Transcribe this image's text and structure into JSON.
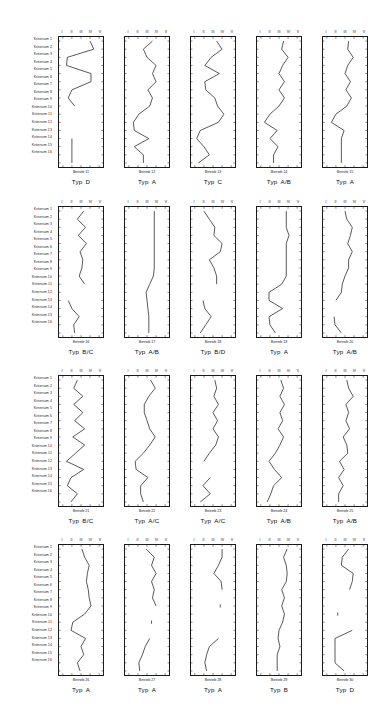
{
  "figure": {
    "criteria_label_prefix": "Kriterium",
    "criteria": [
      "Kriterium  1",
      "Kriterium  2",
      "Kriterium  3",
      "Kriterium  4",
      "Kriterium  5",
      "Kriterium  6",
      "Kriterium  7",
      "Kriterium  8",
      "Kriterium  9",
      "Kriterium 10",
      "Kriterium 11",
      "Kriterium 12",
      "Kriterium 13",
      "Kriterium 14",
      "Kriterium 15",
      "Kriterium 16"
    ],
    "scale_labels": [
      "I",
      "II",
      "III",
      "IV",
      "V"
    ],
    "type_word": "Typ",
    "rows": 4,
    "cols": 5,
    "line_color": "#1a1a1a",
    "frame_color": "#1a1a1a",
    "background": "#ffffff"
  },
  "chart_data": [
    {
      "type": "line",
      "title": "Betrieb 11",
      "subtitle": "Typ  D",
      "betrieb": "Betrieb 11",
      "typ": "D",
      "xlabel": "",
      "ylabel": "Kriterium",
      "xlim": [
        1,
        5
      ],
      "x_ticks": [
        "I",
        "II",
        "III",
        "IV",
        "V"
      ],
      "categories": [
        "Kriterium  1",
        "Kriterium  2",
        "Kriterium  3",
        "Kriterium  4",
        "Kriterium  5",
        "Kriterium  6",
        "Kriterium  7",
        "Kriterium  8",
        "Kriterium  9",
        "Kriterium 10",
        "Kriterium 11",
        "Kriterium 12",
        "Kriterium 13",
        "Kriterium 14",
        "Kriterium 15",
        "Kriterium 16"
      ],
      "values": [
        4.0,
        4.4,
        1.5,
        1.4,
        4.1,
        4.1,
        2.0,
        1.6,
        2.3,
        null,
        null,
        null,
        2.0,
        2.0,
        2.0,
        2.0
      ]
    },
    {
      "type": "line",
      "title": "Betrieb 12",
      "subtitle": "Typ  A",
      "betrieb": "Betrieb 12",
      "typ": "A",
      "xlim": [
        1,
        5
      ],
      "x_ticks": [
        "I",
        "II",
        "III",
        "IV",
        "V"
      ],
      "values": [
        3.6,
        2.6,
        3.0,
        4.0,
        3.6,
        4.0,
        3.1,
        3.6,
        3.3,
        2.1,
        1.5,
        1.6,
        3.2,
        1.6,
        2.6,
        2.6
      ]
    },
    {
      "type": "line",
      "title": "Betrieb 13",
      "subtitle": "Typ  C",
      "betrieb": "Betrieb 13",
      "typ": "C",
      "xlim": [
        1,
        5
      ],
      "x_ticks": [
        "I",
        "II",
        "III",
        "IV",
        "V"
      ],
      "values": [
        3.4,
        4.0,
        2.8,
        2.1,
        3.7,
        2.1,
        2.2,
        3.2,
        3.5,
        4.2,
        3.6,
        1.6,
        1.2,
        2.0,
        2.6,
        1.4
      ]
    },
    {
      "type": "line",
      "title": "Betrieb 14",
      "subtitle": "Typ  A/B",
      "betrieb": "Betrieb 14",
      "typ": "A/B",
      "xlim": [
        1,
        5
      ],
      "x_ticks": [
        "I",
        "II",
        "III",
        "IV",
        "V"
      ],
      "values": [
        3.5,
        3.3,
        4.0,
        3.4,
        3.0,
        3.6,
        3.0,
        3.6,
        3.0,
        2.0,
        1.4,
        2.8,
        2.0,
        2.9,
        2.4,
        2.4
      ]
    },
    {
      "type": "line",
      "title": "Betrieb 15",
      "subtitle": "Typ  A",
      "betrieb": "Betrieb 15",
      "typ": "A",
      "xlim": [
        1,
        5
      ],
      "x_ticks": [
        "I",
        "II",
        "III",
        "IV",
        "V"
      ],
      "values": [
        3.4,
        3.3,
        3.9,
        3.3,
        3.0,
        3.6,
        3.1,
        3.7,
        3.2,
        2.0,
        1.5,
        2.9,
        2.6,
        2.6,
        2.6,
        2.6
      ]
    },
    {
      "type": "line",
      "title": "Betrieb 16",
      "subtitle": "Typ  B/C",
      "betrieb": "Betrieb 16",
      "typ": "B/C",
      "xlim": [
        1,
        5
      ],
      "x_ticks": [
        "I",
        "II",
        "III",
        "IV",
        "V"
      ],
      "values": [
        3.3,
        2.6,
        3.5,
        2.7,
        3.6,
        2.9,
        3.2,
        3.1,
        2.8,
        3.4,
        null,
        1.6,
        2.0,
        2.8,
        2.2,
        2.3
      ]
    },
    {
      "type": "line",
      "title": "Betrieb 17",
      "subtitle": "Typ  A/B",
      "betrieb": "Betrieb 17",
      "typ": "A/B",
      "xlim": [
        1,
        5
      ],
      "x_ticks": [
        "I",
        "II",
        "III",
        "IV",
        "V"
      ],
      "values": [
        3.8,
        3.8,
        3.8,
        3.8,
        3.8,
        3.8,
        3.8,
        3.8,
        3.7,
        3.3,
        2.9,
        3.0,
        3.1,
        3.2,
        3.2,
        3.2
      ]
    },
    {
      "type": "line",
      "title": "Betrieb 18",
      "subtitle": "Typ  B/D",
      "betrieb": "Betrieb 18",
      "typ": "B/D",
      "xlim": [
        1,
        5
      ],
      "x_ticks": [
        "I",
        "II",
        "III",
        "IV",
        "V"
      ],
      "values": [
        2.0,
        2.6,
        3.2,
        3.1,
        4.0,
        3.8,
        2.6,
        3.1,
        3.4,
        3.4,
        null,
        1.9,
        2.1,
        2.8,
        2.2,
        1.6
      ]
    },
    {
      "type": "line",
      "title": "Betrieb 19",
      "subtitle": "Typ  A",
      "betrieb": "Betrieb 19",
      "typ": "A",
      "xlim": [
        1,
        5
      ],
      "x_ticks": [
        "I",
        "II",
        "III",
        "IV",
        "V"
      ],
      "values": [
        3.8,
        3.8,
        3.8,
        4.1,
        3.8,
        3.8,
        3.8,
        3.8,
        3.8,
        3.3,
        1.9,
        1.9,
        3.4,
        1.9,
        2.0,
        2.6
      ]
    },
    {
      "type": "line",
      "title": "Betrieb 20",
      "subtitle": "Typ  A/B",
      "betrieb": "Betrieb 20",
      "typ": "A/B",
      "xlim": [
        1,
        5
      ],
      "x_ticks": [
        "I",
        "II",
        "III",
        "IV",
        "V"
      ],
      "values": [
        3.0,
        3.2,
        3.8,
        3.6,
        3.3,
        3.8,
        3.4,
        3.4,
        3.0,
        2.7,
        2.6,
        2.0,
        null,
        1.8,
        1.9,
        2.6
      ]
    },
    {
      "type": "line",
      "title": "Betrieb 21",
      "subtitle": "Typ  B/C",
      "betrieb": "Betrieb 21",
      "typ": "B/C",
      "xlim": [
        1,
        5
      ],
      "x_ticks": [
        "I",
        "II",
        "III",
        "IV",
        "V"
      ],
      "values": [
        2.6,
        2.2,
        3.2,
        2.2,
        3.2,
        2.3,
        3.4,
        2.1,
        3.4,
        2.4,
        1.4,
        3.3,
        1.9,
        1.5,
        2.6,
        1.9
      ]
    },
    {
      "type": "line",
      "title": "Betrieb 22",
      "subtitle": "Typ  A/C",
      "betrieb": "Betrieb 22",
      "typ": "A/C",
      "xlim": [
        1,
        5
      ],
      "x_ticks": [
        "I",
        "II",
        "III",
        "IV",
        "V"
      ],
      "values": [
        3.4,
        3.9,
        3.2,
        2.7,
        2.7,
        3.0,
        3.3,
        3.9,
        3.3,
        2.6,
        1.7,
        1.8,
        3.1,
        2.3,
        2.3,
        2.6
      ]
    },
    {
      "type": "line",
      "title": "Betrieb 23",
      "subtitle": "Typ  A/C",
      "betrieb": "Betrieb 23",
      "typ": "A/C",
      "xlim": [
        1,
        5
      ],
      "x_ticks": [
        "I",
        "II",
        "III",
        "IV",
        "V"
      ],
      "values": [
        3.2,
        3.4,
        3.1,
        3.6,
        3.0,
        3.5,
        3.0,
        3.6,
        3.3,
        2.6,
        2.0,
        null,
        2.7,
        1.9,
        2.7,
        1.6
      ]
    },
    {
      "type": "line",
      "title": "Betrieb 24",
      "subtitle": "Typ  A/B",
      "betrieb": "Betrieb 24",
      "typ": "A/B",
      "xlim": [
        1,
        5
      ],
      "x_ticks": [
        "I",
        "II",
        "III",
        "IV",
        "V"
      ],
      "values": [
        3.2,
        3.5,
        3.1,
        3.6,
        3.1,
        3.4,
        2.9,
        3.5,
        3.1,
        2.6,
        1.9,
        2.5,
        3.3,
        2.4,
        2.1,
        1.7
      ]
    },
    {
      "type": "line",
      "title": "Betrieb 25",
      "subtitle": "Typ  A/B",
      "betrieb": "Betrieb 25",
      "typ": "A/B",
      "xlim": [
        1,
        5
      ],
      "x_ticks": [
        "I",
        "II",
        "III",
        "IV",
        "V"
      ],
      "values": [
        3.2,
        3.4,
        3.9,
        3.1,
        3.4,
        3.1,
        3.5,
        2.8,
        3.2,
        3.3,
        2.4,
        2.9,
        2.3,
        2.8,
        2.3,
        2.3
      ]
    },
    {
      "type": "line",
      "title": "Betrieb 26",
      "subtitle": "Typ  A",
      "betrieb": "Betrieb 26",
      "typ": "A",
      "xlim": [
        1,
        5
      ],
      "x_ticks": [
        "I",
        "II",
        "III",
        "IV",
        "V"
      ],
      "values": [
        3.1,
        3.4,
        3.9,
        3.7,
        3.6,
        3.8,
        3.9,
        4.1,
        3.4,
        2.1,
        1.9,
        3.5,
        3.0,
        3.3,
        2.6,
        2.9
      ]
    },
    {
      "type": "line",
      "title": "Betrieb 27",
      "subtitle": "Typ  A",
      "betrieb": "Betrieb 27",
      "typ": "A",
      "xlim": [
        1,
        5
      ],
      "x_ticks": [
        "I",
        "II",
        "III",
        "IV",
        "V"
      ],
      "values": [
        2.9,
        3.8,
        3.5,
        4.0,
        3.5,
        3.8,
        3.6,
        4.0,
        null,
        3.5,
        null,
        3.3,
        2.8,
        2.5,
        2.1,
        2.2
      ]
    },
    {
      "type": "line",
      "title": "Betrieb 28",
      "subtitle": "Typ  A",
      "betrieb": "Betrieb 28",
      "typ": "A",
      "xlim": [
        1,
        5
      ],
      "x_ticks": [
        "I",
        "II",
        "III",
        "IV",
        "V"
      ],
      "values": [
        4.0,
        4.0,
        3.6,
        3.1,
        3.9,
        4.0,
        null,
        3.8,
        null,
        null,
        null,
        3.6,
        2.6,
        2.3,
        2.1,
        2.3
      ]
    },
    {
      "type": "line",
      "title": "Betrieb 29",
      "subtitle": "Typ  B",
      "betrieb": "Betrieb 29",
      "typ": "B",
      "xlim": [
        1,
        5
      ],
      "x_ticks": [
        "I",
        "II",
        "III",
        "IV",
        "V"
      ],
      "values": [
        3.9,
        3.5,
        3.8,
        3.9,
        3.8,
        3.3,
        3.6,
        3.3,
        3.6,
        3.4,
        3.0,
        2.9,
        3.1,
        2.8,
        2.8,
        2.8
      ]
    },
    {
      "type": "line",
      "title": "Betrieb 30",
      "subtitle": "Typ  D",
      "betrieb": "Betrieb 30",
      "typ": "D",
      "xlim": [
        1,
        5
      ],
      "x_ticks": [
        "I",
        "II",
        "III",
        "IV",
        "V"
      ],
      "values": [
        3.4,
        2.7,
        2.6,
        3.9,
        3.8,
        3.5,
        null,
        null,
        2.2,
        null,
        3.8,
        1.9,
        1.9,
        1.9,
        1.9,
        2.9
      ]
    }
  ]
}
